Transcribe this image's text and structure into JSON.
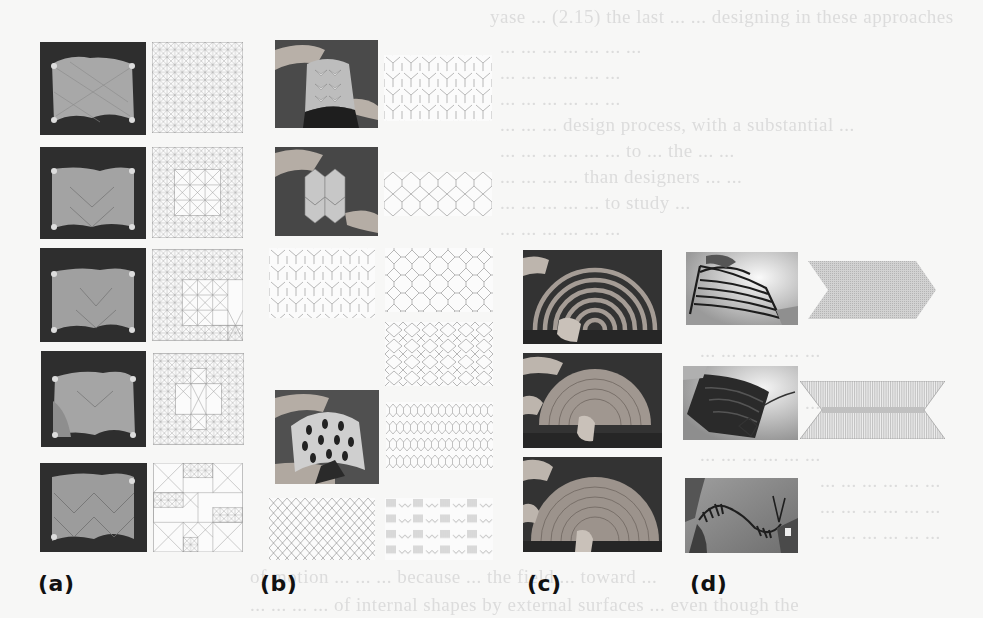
{
  "figure": {
    "panel_labels": {
      "a": "(a)",
      "b": "(b)",
      "c": "(c)",
      "d": "(d)"
    },
    "panels": [
      {
        "id": "a",
        "description": "Five rows of fabricated square sheets (photos) each paired with a crease/cut pattern of X-cross tiles at varying density",
        "rows": 5
      },
      {
        "id": "b",
        "description": "Hand-held curved tessellated surfaces with Y-shaped and diamond lattice cut patterns",
        "photos": 3,
        "patterns": 8
      },
      {
        "id": "c",
        "description": "Concentric semicircular ring structure being bent by hand, three states",
        "photos": 3
      },
      {
        "id": "d",
        "description": "Twisting/folding ribbon structures with chevron and hourglass line patterns",
        "photos": 3,
        "patterns": 2
      }
    ],
    "background_bleed_text": [
      "yase ... (2.15) the last ...      ... designing in these approaches",
      "... ... ... ... ... ... ...",
      "... ... ... ... ... ...",
      "... ... ... ... ... ...",
      "... ... ... design process, with a substantial ...",
      "... ... ... ... ... ... to ... the ... ...",
      "... ... ... ... than designers ... ...",
      "... ... ... ... ... to study ...",
      "... ... ... ... ... ...",
      "... ... ... ... ... ...",
      "... ... ... ... ... ...",
      "... ... ... ... ... ...",
      "... ... ... ... ... ...",
      "... ... ... ... ... ...",
      "... ... ... ... ... ...",
      "... ... ... ... ... ...",
      "... ... ... ... ... ...",
      "of motion ... ... ... because ... the field ... toward ...",
      "... ... ... ... of internal shapes by external surfaces ... even though the"
    ]
  }
}
